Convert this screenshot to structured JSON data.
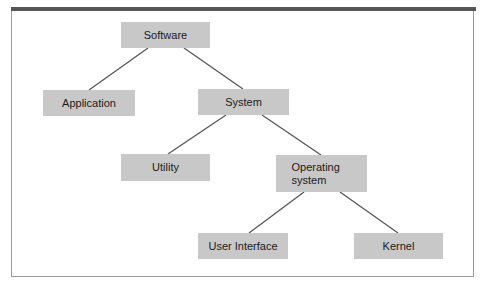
{
  "diagram": {
    "type": "tree",
    "nodes": [
      {
        "id": "software",
        "label": "Software"
      },
      {
        "id": "application",
        "label": "Application"
      },
      {
        "id": "system",
        "label": "System"
      },
      {
        "id": "utility",
        "label": "Utility"
      },
      {
        "id": "operating_system",
        "label": "Operating system"
      },
      {
        "id": "user_interface",
        "label": "User Interface"
      },
      {
        "id": "kernel",
        "label": "Kernel"
      }
    ],
    "edges": [
      [
        "software",
        "application"
      ],
      [
        "software",
        "system"
      ],
      [
        "system",
        "utility"
      ],
      [
        "system",
        "operating_system"
      ],
      [
        "operating_system",
        "user_interface"
      ],
      [
        "operating_system",
        "kernel"
      ]
    ]
  },
  "colors": {
    "node_fill": "#c8c8c8",
    "edge": "#555555",
    "frame_top_bar": "#555555",
    "frame_border": "#9a9a9a"
  }
}
